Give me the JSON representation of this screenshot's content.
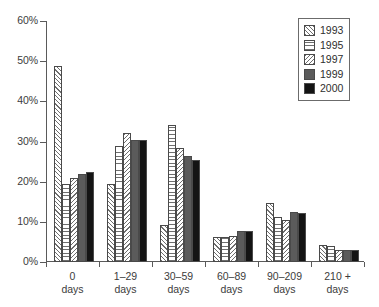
{
  "chart_data": {
    "type": "bar",
    "title": "",
    "subtitle": "",
    "xlabel": "",
    "ylabel": "",
    "ylim": [
      0,
      60
    ],
    "ytick_labels": [
      "0%",
      "10%",
      "20%",
      "30%",
      "40%",
      "50%",
      "60%"
    ],
    "ytick_values": [
      0,
      10,
      20,
      30,
      40,
      50,
      60
    ],
    "grid": false,
    "legend_position": "top-right",
    "categories": [
      {
        "line1": "0",
        "line2": "days"
      },
      {
        "line1": "1–29",
        "line2": "days"
      },
      {
        "line1": "30–59",
        "line2": "days"
      },
      {
        "line1": "60–89",
        "line2": "days"
      },
      {
        "line1": "90–209",
        "line2": "days"
      },
      {
        "line1": "210 +",
        "line2": "days"
      }
    ],
    "series": [
      {
        "name": "1993",
        "pattern": "diagonal-hatch-forward",
        "color": "#ffffff",
        "values": [
          48.7,
          19.5,
          9.3,
          6.3,
          14.8,
          4.3
        ]
      },
      {
        "name": "1995",
        "pattern": "horizontal-lines",
        "color": "#ffffff",
        "values": [
          19.5,
          29.0,
          34.0,
          6.3,
          11.2,
          4.0
        ]
      },
      {
        "name": "1997",
        "pattern": "diagonal-hatch-back",
        "color": "#ffffff",
        "values": [
          21.0,
          32.0,
          28.3,
          6.6,
          10.5,
          3.0
        ]
      },
      {
        "name": "1999",
        "pattern": "solid-gray",
        "color": "#5b5b5b",
        "values": [
          22.0,
          30.5,
          26.3,
          7.6,
          12.5,
          3.0
        ]
      },
      {
        "name": "2000",
        "pattern": "solid-black",
        "color": "#141414",
        "values": [
          22.3,
          30.3,
          25.5,
          7.8,
          12.3,
          3.0
        ]
      }
    ]
  }
}
